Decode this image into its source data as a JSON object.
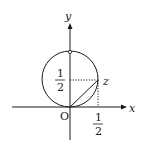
{
  "diagram": {
    "axes": {
      "x_label": "x",
      "y_label": "y",
      "origin_label": "O"
    },
    "point_label": "z",
    "x_tick": {
      "num": "1",
      "den": "2"
    },
    "y_tick": {
      "num": "1",
      "den": "2"
    },
    "circle": {
      "center": [
        0,
        0.5
      ],
      "radius": 0.5
    },
    "point_z": [
      0.5,
      0.5
    ],
    "colors": {
      "stroke": "#1a1a1a",
      "background": "#ffffff"
    }
  }
}
